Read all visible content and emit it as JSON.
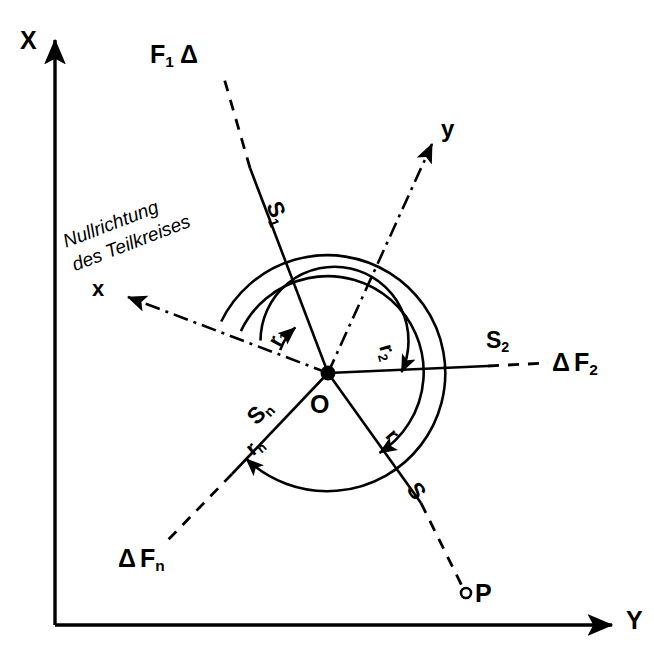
{
  "figure": {
    "type": "technical-diagram",
    "background_color": "#ffffff",
    "ink_color": "#000000"
  },
  "axes": {
    "vertical": {
      "label": "X",
      "direction": "up",
      "style": "solid-arrow"
    },
    "horizontal": {
      "label": "Y",
      "direction": "right",
      "style": "solid-arrow"
    }
  },
  "local_axes": {
    "y_axis": {
      "label": "y",
      "style": "dash-dot-arrow",
      "direction": "upper-right"
    },
    "x_axis": {
      "label": "x",
      "style": "dash-dot-arrow",
      "direction": "upper-left"
    }
  },
  "annotations": {
    "zero_direction": {
      "line1": "Nullrichtung",
      "line2": "des Teilkreises"
    },
    "station": {
      "label": "O",
      "description": "instrument station (center point)"
    },
    "target_point": {
      "marker": "o",
      "label": "P"
    }
  },
  "directions": [
    {
      "id": "s1",
      "label": "S",
      "sub": "1",
      "target_label": "F",
      "target_sub": "1",
      "target_prefix": "",
      "target_suffix": "Δ"
    },
    {
      "id": "s2",
      "label": "S",
      "sub": "2",
      "target_label": "F",
      "target_sub": "2",
      "target_prefix": "Δ",
      "target_suffix": ""
    },
    {
      "id": "sn",
      "label": "S",
      "sub": "n",
      "target_label": "F",
      "target_sub": "n",
      "target_prefix": "Δ",
      "target_suffix": ""
    },
    {
      "id": "s",
      "label": "S",
      "sub": "",
      "target_label": "P",
      "target_sub": "",
      "target_prefix": "",
      "target_suffix": ""
    }
  ],
  "circle_readings": [
    {
      "id": "r1",
      "label": "r",
      "sub": "1",
      "arc_radius": 52,
      "to_direction": "s1"
    },
    {
      "id": "r2",
      "label": "r",
      "sub": "2",
      "arc_radius": 74,
      "to_direction": "s2"
    },
    {
      "id": "r",
      "label": "r",
      "sub": "",
      "arc_radius": 96,
      "to_direction": "s"
    },
    {
      "id": "rn",
      "label": "r",
      "sub": "n",
      "arc_radius": 118,
      "to_direction": "sn"
    }
  ],
  "labels": {
    "axis_x": "X",
    "axis_y": "Y",
    "local_y": "y",
    "local_x": "x",
    "null_line1": "Nullrichtung",
    "null_line2": "des Teilkreises",
    "origin": "O",
    "point_p": "P",
    "delta": "Δ",
    "s1_main": "S",
    "s1_sub": "1",
    "s2_main": "S",
    "s2_sub": "2",
    "sn_main": "S",
    "sn_sub": "n",
    "s_main": "S",
    "r1_main": "r",
    "r1_sub": "1",
    "r2_main": "r",
    "r2_sub": "2",
    "r_main": "r",
    "rn_main": "r",
    "rn_sub": "n",
    "f1_main": "F",
    "f1_sub": "1",
    "f2_main": "F",
    "f2_sub": "2",
    "fn_main": "F",
    "fn_sub": "n"
  }
}
